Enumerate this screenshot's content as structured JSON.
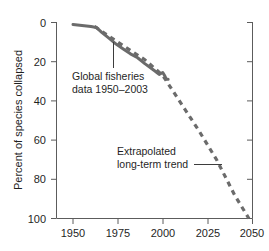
{
  "chart_data": {
    "type": "line",
    "title": "",
    "xlabel": "",
    "ylabel": "Percent of species collapsed",
    "xlim": [
      1941,
      2058
    ],
    "ylim": [
      0,
      100
    ],
    "y_inverted": true,
    "grid": false,
    "legend_position": "none",
    "xticks": [
      "1950",
      "1975",
      "2000",
      "2025",
      "2050"
    ],
    "xtick_values": [
      1950,
      1975,
      2000,
      2025,
      2050
    ],
    "yticks": [
      "0",
      "20",
      "40",
      "60",
      "80",
      "100"
    ],
    "ytick_values": [
      0,
      20,
      40,
      60,
      80,
      100
    ],
    "series": [
      {
        "name": "Global fisheries data 1950-2003",
        "style": "solid",
        "color": "#6b6b6b",
        "x": [
          1950,
          1955,
          1960,
          1963,
          1966,
          1970,
          1974,
          1978,
          1982,
          1986,
          1990,
          1993,
          1996,
          1998,
          2000,
          2001,
          2002,
          2003
        ],
        "values": [
          1,
          1.5,
          2,
          2.5,
          5,
          8,
          11,
          13.5,
          16,
          18,
          21,
          23,
          25,
          26.5,
          25.5,
          27,
          29,
          29
        ]
      },
      {
        "name": "Extrapolated long-term trend",
        "style": "dashed",
        "color": "#6b6b6b",
        "x": [
          1962,
          1970,
          1980,
          1990,
          2000,
          2010,
          2020,
          2030,
          2040,
          2048
        ],
        "values": [
          2,
          7,
          13,
          19,
          27,
          41,
          55,
          70,
          88,
          100
        ]
      }
    ],
    "annotations": [
      {
        "id": "annotation-fisheries",
        "line1": "Global fisheries",
        "line2": "data 1950–2003",
        "leader": "vertical"
      },
      {
        "id": "annotation-extrapolated",
        "line1": "Extrapolated",
        "line2": "long-term trend",
        "leader": "horizontal"
      }
    ]
  }
}
